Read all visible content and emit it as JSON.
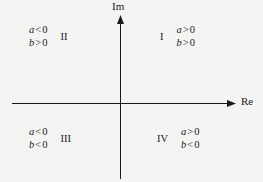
{
  "figure": {
    "type": "complex-plane-quadrant-diagram",
    "background_color": "#f4f4f2",
    "line_color": "#1a1a1a"
  },
  "axes": {
    "imaginary": {
      "label": "Im",
      "orientation": "vertical",
      "arrow": "up"
    },
    "real": {
      "label": "Re",
      "orientation": "horizontal",
      "arrow": "right"
    }
  },
  "quadrants": [
    {
      "numeral": "I",
      "numeral_position": "before",
      "conditions": [
        {
          "var": "a",
          "op": ">",
          "num": "0"
        },
        {
          "var": "b",
          "op": ">",
          "num": "0"
        }
      ]
    },
    {
      "numeral": "II",
      "numeral_position": "after",
      "conditions": [
        {
          "var": "a",
          "op": "<",
          "num": "0"
        },
        {
          "var": "b",
          "op": ">",
          "num": "0"
        }
      ]
    },
    {
      "numeral": "III",
      "numeral_position": "after",
      "conditions": [
        {
          "var": "a",
          "op": "<",
          "num": "0"
        },
        {
          "var": "b",
          "op": "<",
          "num": "0"
        }
      ]
    },
    {
      "numeral": "IV",
      "numeral_position": "before",
      "conditions": [
        {
          "var": "a",
          "op": ">",
          "num": "0"
        },
        {
          "var": "b",
          "op": "<",
          "num": "0"
        }
      ]
    }
  ]
}
